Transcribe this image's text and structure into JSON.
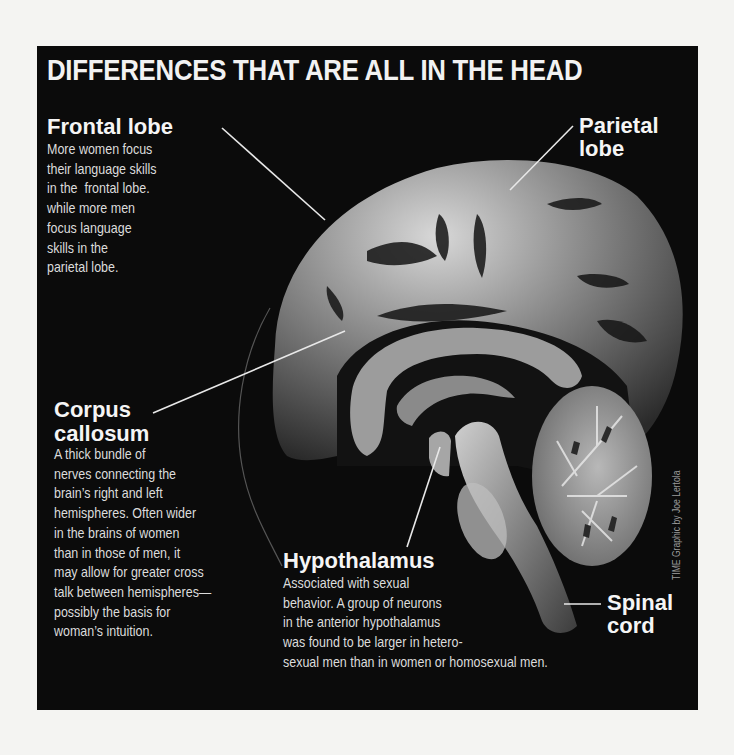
{
  "title": "DIFFERENCES THAT ARE ALL IN THE HEAD",
  "labels": {
    "frontal": {
      "heading": "Frontal lobe",
      "body": "More women focus\ntheir language skills\nin the  frontal lobe.\nwhile more men\nfocus language\nskills in the\nparietal lobe."
    },
    "parietal": {
      "heading_line1": "Parietal",
      "heading_line2": "lobe"
    },
    "corpus": {
      "heading_line1": "Corpus",
      "heading_line2": "callosum",
      "body": "A thick bundle of\nnerves connecting the\nbrain’s right and left\nhemispheres. Often wider\nin the brains of women\nthan in those of men, it\nmay allow for greater cross\ntalk between hemispheres—\npossibly the basis for\nwoman’s intuition."
    },
    "hypothalamus": {
      "heading": "Hypothalamus",
      "body": "Associated with sexual\nbehavior. A group of neurons\nin the anterior hypothalamus\nwas found to be larger in hetero-\nsexual men than in women or homosexual men."
    },
    "spinal": {
      "heading_line1": "Spinal",
      "heading_line2": "cord"
    }
  },
  "credit": "TIME Graphic by Joe Lertola",
  "colors": {
    "panel": "#0b0b0b",
    "page": "#f4f4f2",
    "text": "#f5f5f5"
  }
}
